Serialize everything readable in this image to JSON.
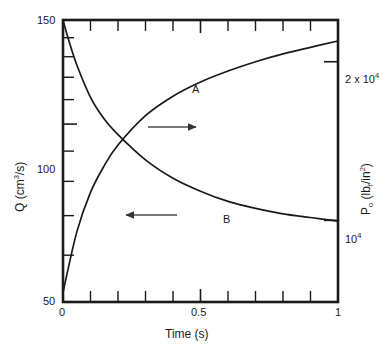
{
  "chart_data": {
    "type": "line",
    "title": "",
    "xlabel": "Time (s)",
    "ylabel": "Q (cm3/s)",
    "ylabel_right": "Po (lbf/in2)",
    "xlim": [
      0,
      1
    ],
    "ylim_left": [
      50,
      150
    ],
    "ylim_right": [
      7000,
      24000
    ],
    "left_axis_scale": "log",
    "right_axis_scale": "log",
    "grid": false,
    "legend": "none",
    "x_ticks_major": [
      0,
      0.5,
      1
    ],
    "x_ticklabels": [
      "0",
      "0.5",
      "1"
    ],
    "x_ticks_minor": [
      0.1,
      0.2,
      0.3,
      0.4,
      0.6,
      0.7,
      0.8,
      0.9
    ],
    "y_left_ticklabels": [
      "150",
      "100",
      "50"
    ],
    "y_left_ticks_major": [
      150,
      100,
      50
    ],
    "y_left_ticks_minor": [
      140,
      130,
      120,
      110,
      90,
      80,
      70,
      60
    ],
    "y_right_ticklabels": [
      "2 x 10",
      "10"
    ],
    "y_right_tick_exponents": [
      "4",
      "4"
    ],
    "y_right_ticks_major": [
      20000,
      10000
    ],
    "series": [
      {
        "name": "A",
        "label": "A",
        "axis": "right",
        "arrow": "right",
        "arrow_meaning": "curve A reads on the right-hand Po axis",
        "x": [
          0,
          0.05,
          0.1,
          0.15,
          0.2,
          0.3,
          0.4,
          0.5,
          0.6,
          0.7,
          0.8,
          0.9,
          1.0
        ],
        "values": [
          7300,
          9500,
          11300,
          12700,
          13900,
          15800,
          17200,
          18300,
          19200,
          20000,
          20700,
          21300,
          21900
        ]
      },
      {
        "name": "B",
        "label": "B",
        "axis": "left",
        "arrow": "left",
        "arrow_meaning": "curve B reads on the left-hand Q axis",
        "x": [
          0,
          0.02,
          0.05,
          0.1,
          0.15,
          0.2,
          0.3,
          0.4,
          0.5,
          0.6,
          0.7,
          0.8,
          0.9,
          1.0
        ],
        "values": [
          150,
          139,
          126,
          111,
          102,
          96,
          87,
          81,
          77,
          74,
          72,
          70.5,
          69.5,
          68.5
        ]
      }
    ],
    "annotations": [
      {
        "text": "A",
        "x": 0.52,
        "y": 19600
      },
      {
        "text": "B",
        "x": 0.66,
        "y": 77
      },
      {
        "text": "arrow-right",
        "x": 0.42,
        "y": 14200
      },
      {
        "text": "arrow-left",
        "x": 0.38,
        "y": 86
      }
    ]
  },
  "axes": {
    "x_title": "Time (s)",
    "x_labels": [
      "0",
      "0.5",
      "1"
    ],
    "y_left_title_prefix": "Q (cm",
    "y_left_title_sup": "3",
    "y_left_title_suffix": "/s)",
    "y_left_labels": [
      "150",
      "100",
      "50"
    ],
    "y_right_title_prefix": "P",
    "y_right_title_sub": "o",
    "y_right_title_mid": " (lb",
    "y_right_title_sub2": "f",
    "y_right_title_mid2": "/in",
    "y_right_title_sup": "2",
    "y_right_title_suffix": ")",
    "y_right_label_top_base": "2 x 10",
    "y_right_label_top_exp": "4",
    "y_right_label_bottom_base": "10",
    "y_right_label_bottom_exp": "4"
  },
  "curves": {
    "a_label": "A",
    "b_label": "B"
  },
  "colors": {
    "axis": "#1a1a1a",
    "curve": "#1a1a1a",
    "arrow": "#555555",
    "background": "#ffffff"
  }
}
